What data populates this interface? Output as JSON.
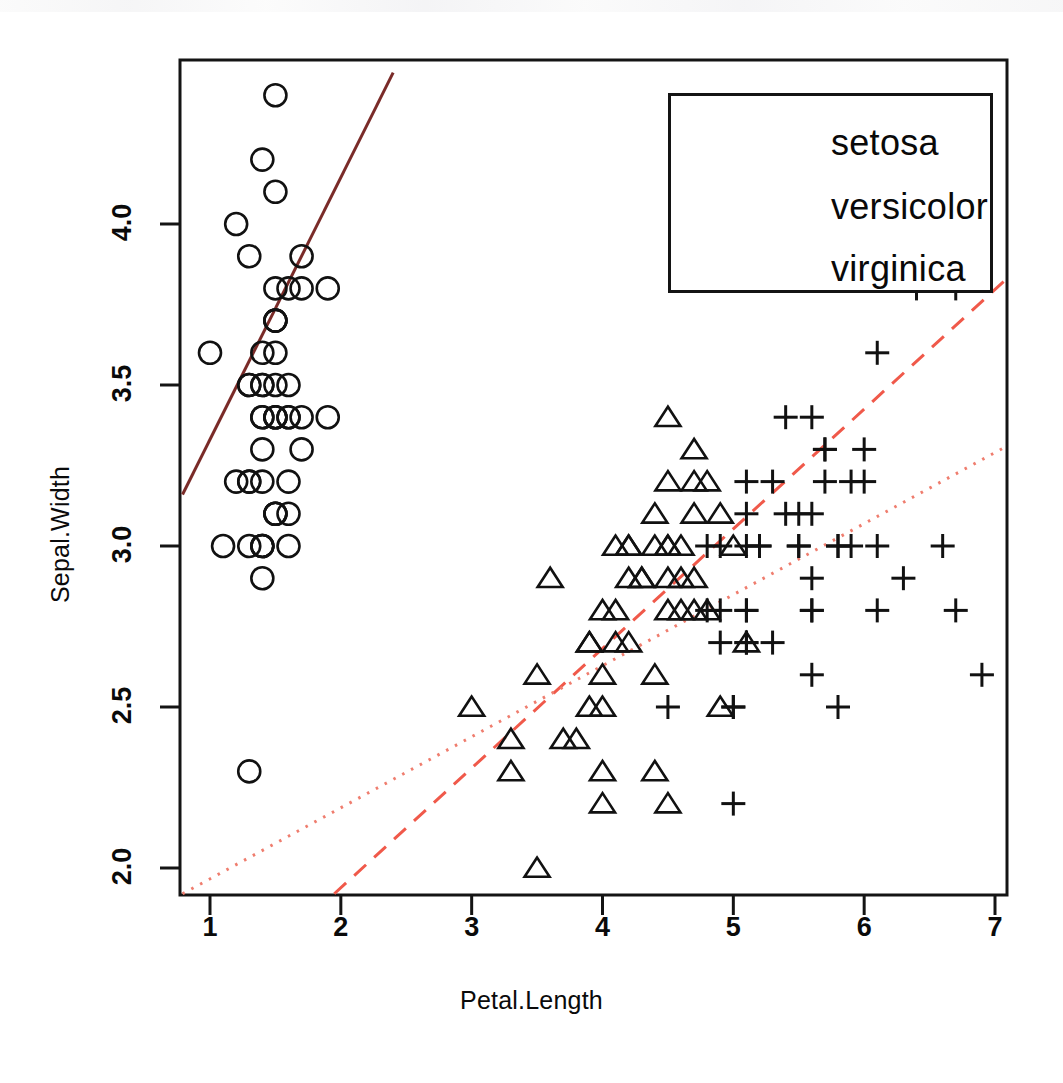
{
  "figure": {
    "type": "scatter",
    "title": "",
    "background": "#ffffff",
    "border_color": "#141414"
  },
  "axes": {
    "xlabel": "Petal.Length",
    "ylabel": "Sepal.Width",
    "xticks": [
      "1",
      "2",
      "3",
      "4",
      "5",
      "6",
      "7"
    ],
    "yticks": [
      "2.0",
      "2.5",
      "3.0",
      "3.5",
      "4.0"
    ],
    "xlim": [
      0.79,
      7.09
    ],
    "ylim": [
      1.92,
      4.47
    ]
  },
  "legend": {
    "position": "top-right",
    "entries": [
      {
        "label": "setosa",
        "style": "solid",
        "color": "#7a2b28"
      },
      {
        "label": "versicolor",
        "style": "dashed",
        "color": "#f0594a"
      },
      {
        "label": "virginica",
        "style": "dotted",
        "color": "#ef7d6e"
      }
    ]
  },
  "chart_data": {
    "type": "scatter",
    "title": "",
    "xlabel": "Petal.Length",
    "ylabel": "Sepal.Width",
    "xlim": [
      0.79,
      7.09
    ],
    "ylim": [
      1.92,
      4.47
    ],
    "xticks": [
      1,
      2,
      3,
      4,
      5,
      6,
      7
    ],
    "yticks": [
      2.0,
      2.5,
      3.0,
      3.5,
      4.0
    ],
    "grid": false,
    "legend_position": "top-right",
    "series": [
      {
        "name": "setosa",
        "marker": "circle",
        "marker_color": "#111111",
        "line_style": "solid",
        "line_color": "#7a2b28",
        "points": [
          [
            1.4,
            3.5
          ],
          [
            1.4,
            3.0
          ],
          [
            1.3,
            3.2
          ],
          [
            1.5,
            3.1
          ],
          [
            1.4,
            3.6
          ],
          [
            1.7,
            3.9
          ],
          [
            1.4,
            3.4
          ],
          [
            1.5,
            3.4
          ],
          [
            1.4,
            2.9
          ],
          [
            1.5,
            3.1
          ],
          [
            1.5,
            3.7
          ],
          [
            1.6,
            3.4
          ],
          [
            1.4,
            3.0
          ],
          [
            1.1,
            3.0
          ],
          [
            1.2,
            4.0
          ],
          [
            1.5,
            4.4
          ],
          [
            1.3,
            3.9
          ],
          [
            1.4,
            3.5
          ],
          [
            1.7,
            3.8
          ],
          [
            1.5,
            3.8
          ],
          [
            1.7,
            3.4
          ],
          [
            1.5,
            3.7
          ],
          [
            1.0,
            3.6
          ],
          [
            1.7,
            3.3
          ],
          [
            1.9,
            3.4
          ],
          [
            1.6,
            3.0
          ],
          [
            1.6,
            3.4
          ],
          [
            1.5,
            3.5
          ],
          [
            1.4,
            3.4
          ],
          [
            1.6,
            3.2
          ],
          [
            1.6,
            3.1
          ],
          [
            1.5,
            3.4
          ],
          [
            1.5,
            4.1
          ],
          [
            1.4,
            4.2
          ],
          [
            1.5,
            3.1
          ],
          [
            1.2,
            3.2
          ],
          [
            1.3,
            3.5
          ],
          [
            1.5,
            3.6
          ],
          [
            1.3,
            3.0
          ],
          [
            1.5,
            3.4
          ],
          [
            1.3,
            3.5
          ],
          [
            1.3,
            2.3
          ],
          [
            1.3,
            3.2
          ],
          [
            1.6,
            3.5
          ],
          [
            1.9,
            3.8
          ],
          [
            1.4,
            3.0
          ],
          [
            1.6,
            3.8
          ],
          [
            1.4,
            3.2
          ],
          [
            1.5,
            3.7
          ],
          [
            1.4,
            3.3
          ]
        ],
        "fit_line": {
          "x": [
            0.79,
            2.4
          ],
          "y": [
            3.16,
            4.47
          ]
        }
      },
      {
        "name": "versicolor",
        "marker": "triangle",
        "marker_color": "#111111",
        "line_style": "dashed",
        "line_color": "#f0594a",
        "points": [
          [
            4.7,
            3.2
          ],
          [
            4.5,
            3.2
          ],
          [
            4.9,
            3.1
          ],
          [
            4.0,
            2.3
          ],
          [
            4.6,
            2.8
          ],
          [
            4.5,
            2.8
          ],
          [
            4.7,
            3.3
          ],
          [
            3.3,
            2.4
          ],
          [
            4.6,
            2.9
          ],
          [
            3.9,
            2.7
          ],
          [
            3.5,
            2.0
          ],
          [
            4.2,
            3.0
          ],
          [
            4.0,
            2.2
          ],
          [
            4.7,
            2.9
          ],
          [
            3.6,
            2.9
          ],
          [
            4.4,
            3.1
          ],
          [
            4.5,
            3.0
          ],
          [
            4.1,
            2.7
          ],
          [
            4.5,
            2.2
          ],
          [
            3.9,
            2.5
          ],
          [
            4.8,
            3.2
          ],
          [
            4.0,
            2.8
          ],
          [
            4.9,
            2.5
          ],
          [
            4.7,
            2.8
          ],
          [
            4.3,
            2.9
          ],
          [
            4.4,
            3.0
          ],
          [
            4.8,
            2.8
          ],
          [
            5.0,
            3.0
          ],
          [
            4.5,
            2.9
          ],
          [
            3.5,
            2.6
          ],
          [
            3.8,
            2.4
          ],
          [
            3.7,
            2.4
          ],
          [
            3.9,
            2.7
          ],
          [
            5.1,
            2.7
          ],
          [
            4.5,
            3.0
          ],
          [
            4.5,
            3.4
          ],
          [
            4.7,
            3.1
          ],
          [
            4.4,
            2.3
          ],
          [
            4.1,
            3.0
          ],
          [
            4.0,
            2.5
          ],
          [
            4.4,
            2.6
          ],
          [
            4.6,
            3.0
          ],
          [
            4.0,
            2.6
          ],
          [
            3.3,
            2.3
          ],
          [
            4.2,
            2.7
          ],
          [
            4.2,
            3.0
          ],
          [
            4.2,
            2.9
          ],
          [
            4.3,
            2.9
          ],
          [
            3.0,
            2.5
          ],
          [
            4.1,
            2.8
          ]
        ],
        "fit_line": {
          "x": [
            1.95,
            7.09
          ],
          "y": [
            1.92,
            3.83
          ]
        }
      },
      {
        "name": "virginica",
        "marker": "plus",
        "marker_color": "#111111",
        "line_style": "dotted",
        "line_color": "#ef7d6e",
        "points": [
          [
            6.0,
            3.3
          ],
          [
            5.1,
            2.7
          ],
          [
            5.9,
            3.0
          ],
          [
            5.6,
            2.9
          ],
          [
            5.8,
            3.0
          ],
          [
            6.6,
            3.0
          ],
          [
            4.5,
            2.5
          ],
          [
            6.3,
            2.9
          ],
          [
            5.8,
            2.5
          ],
          [
            6.1,
            3.6
          ],
          [
            5.1,
            3.2
          ],
          [
            5.3,
            2.7
          ],
          [
            5.5,
            3.0
          ],
          [
            5.0,
            2.5
          ],
          [
            5.1,
            2.8
          ],
          [
            5.3,
            3.2
          ],
          [
            5.5,
            3.0
          ],
          [
            6.7,
            3.8
          ],
          [
            6.9,
            2.6
          ],
          [
            5.0,
            2.2
          ],
          [
            5.7,
            3.2
          ],
          [
            4.9,
            2.8
          ],
          [
            6.7,
            2.8
          ],
          [
            4.9,
            2.7
          ],
          [
            5.7,
            3.3
          ],
          [
            6.0,
            3.2
          ],
          [
            4.8,
            2.8
          ],
          [
            4.9,
            3.0
          ],
          [
            5.6,
            2.8
          ],
          [
            5.8,
            3.0
          ],
          [
            6.1,
            2.8
          ],
          [
            6.4,
            3.8
          ],
          [
            5.6,
            2.8
          ],
          [
            5.1,
            2.8
          ],
          [
            5.6,
            2.6
          ],
          [
            6.1,
            3.0
          ],
          [
            5.6,
            3.4
          ],
          [
            5.5,
            3.1
          ],
          [
            4.8,
            3.0
          ],
          [
            5.4,
            3.1
          ],
          [
            5.6,
            3.1
          ],
          [
            5.1,
            3.1
          ],
          [
            5.1,
            2.7
          ],
          [
            5.9,
            3.2
          ],
          [
            5.7,
            3.3
          ],
          [
            5.2,
            3.0
          ],
          [
            5.0,
            2.5
          ],
          [
            5.2,
            3.0
          ],
          [
            5.4,
            3.4
          ],
          [
            5.1,
            3.0
          ]
        ],
        "fit_line": {
          "x": [
            0.79,
            7.09
          ],
          "y": [
            1.92,
            3.31
          ]
        }
      }
    ]
  }
}
